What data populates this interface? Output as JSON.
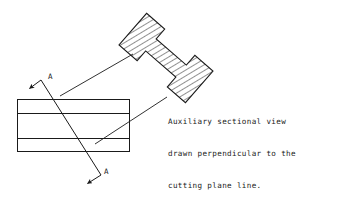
{
  "drawing": {
    "title": "Auxiliary sectional view technical drawing",
    "background_color": "#ffffff",
    "line_color": "#1a1a1a",
    "hatch_color": "#2b2b2b",
    "annotation": {
      "lines": [
        "Auxiliary sectional view",
        "drawn perpendicular to the",
        "cutting plane line."
      ],
      "full_text": "Auxiliary sectional view drawn perpendicular to the cutting plane line."
    },
    "section_labels": {
      "top": "A",
      "bottom": "A"
    },
    "parts": {
      "plan_view_name": "rectangular plan view",
      "section_view_name": "hatched I-beam auxiliary section",
      "cutting_plane_name": "cutting plane line A-A",
      "leader_upper_name": "leader line to section view top",
      "leader_lower_name": "leader line to section view bottom"
    },
    "geometry": {
      "plan_rect": {
        "x": 17,
        "y": 99,
        "width": 113,
        "height": 53
      },
      "plan_internal_lines_y": [
        113,
        138
      ],
      "cutting_plane": {
        "x1": 41,
        "y1": 80,
        "x2": 101,
        "y2": 175
      },
      "arrow_top": {
        "x1": 41,
        "y1": 80,
        "x2": 28,
        "y2": 89
      },
      "arrow_bottom": {
        "x1": 101,
        "y1": 175,
        "x2": 86,
        "y2": 184
      },
      "label_top": {
        "x": 48,
        "y": 77
      },
      "label_bottom": {
        "x": 104,
        "y": 172
      },
      "leader_upper": {
        "x1": 60,
        "y1": 96,
        "x2": 133,
        "y2": 54
      },
      "leader_lower": {
        "x1": 95,
        "y1": 144,
        "x2": 167,
        "y2": 97
      }
    }
  }
}
